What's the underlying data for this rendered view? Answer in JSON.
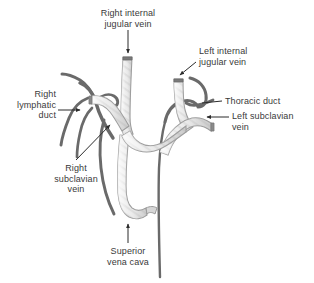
{
  "figure": {
    "type": "anatomical-diagram",
    "background_color": "#ffffff",
    "vessel_fill_color": "#e8e8e8",
    "vessel_outline_color": "#9a9a9a",
    "duct_color": "#6a6a6a",
    "label_color": "#3a3a3a",
    "leader_color": "#2b2b2b"
  },
  "labels": {
    "right_internal_jugular_vein": {
      "line1": "Right internal",
      "line2": "jugular vein"
    },
    "left_internal_jugular_vein": {
      "line1": "Left internal",
      "line2": "jugular vein"
    },
    "thoracic_duct": {
      "line1": "Thoracic duct"
    },
    "left_subclavian_vein": {
      "line1": "Left subclavian",
      "line2": "vein"
    },
    "right_lymphatic_duct": {
      "line1": "Right",
      "line2": "lymphatic",
      "line3": "duct"
    },
    "right_subclavian_vein": {
      "line1": "Right",
      "line2": "subclavian",
      "line3": "vein"
    },
    "superior_vena_cava": {
      "line1": "Superior",
      "line2": "vena cava"
    }
  },
  "structures": [
    {
      "name": "right-internal-jugular-vein",
      "kind": "vein"
    },
    {
      "name": "left-internal-jugular-vein",
      "kind": "vein"
    },
    {
      "name": "right-subclavian-vein",
      "kind": "vein"
    },
    {
      "name": "left-subclavian-vein",
      "kind": "vein"
    },
    {
      "name": "superior-vena-cava",
      "kind": "vein"
    },
    {
      "name": "right-lymphatic-duct",
      "kind": "lymphatic-duct"
    },
    {
      "name": "thoracic-duct",
      "kind": "lymphatic-duct"
    }
  ]
}
